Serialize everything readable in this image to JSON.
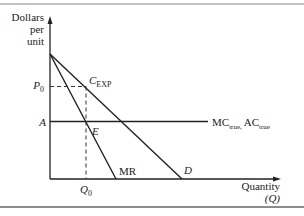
{
  "chart_data": {
    "type": "line",
    "title": "",
    "ylabel_lines": [
      "Dollars",
      "per",
      "unit"
    ],
    "xlabel_lines": [
      "Quantity",
      "(Q)"
    ],
    "xlim": [
      0,
      10
    ],
    "ylim": [
      0,
      10
    ],
    "series": [
      {
        "name": "D",
        "label": "D",
        "points": [
          [
            0,
            10
          ],
          [
            6.6,
            0
          ]
        ]
      },
      {
        "name": "MR",
        "label": "MR",
        "points": [
          [
            0,
            10
          ],
          [
            3.3,
            0
          ]
        ]
      },
      {
        "name": "MC_true_AC_true",
        "label_main1": "MC",
        "label_sub1": "true,",
        "label_main2": "AC",
        "label_sub2": "true",
        "points": [
          [
            0,
            4.6
          ],
          [
            7.9,
            4.6
          ]
        ]
      }
    ],
    "guides": [
      {
        "name": "P0-guide",
        "points": [
          [
            0,
            7.4
          ],
          [
            1.8,
            7.4
          ]
        ]
      },
      {
        "name": "Q0-guide",
        "points": [
          [
            1.8,
            7.4
          ],
          [
            1.8,
            0
          ]
        ]
      }
    ],
    "annotations": {
      "P0": {
        "main": "P",
        "sub": "0",
        "y": 7.4
      },
      "A": {
        "text": "A",
        "y": 4.6
      },
      "Q0": {
        "main": "Q",
        "sub": "0",
        "x": 1.8
      },
      "C_EXP": {
        "main": "C",
        "sub": "EXP",
        "x": 1.8,
        "y": 7.4
      },
      "E": {
        "text": "E",
        "x": 1.8,
        "y": 4.6
      }
    }
  }
}
